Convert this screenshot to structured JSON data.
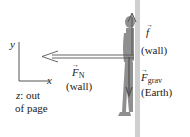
{
  "axes": {
    "y_label": "y",
    "x_label": "x",
    "z_note_var": "z",
    "z_note_text": ": out",
    "z_note_line2": "of page"
  },
  "forces": {
    "normal": {
      "symbol": "F",
      "subscript": "N",
      "source": "(wall)",
      "direction": "left"
    },
    "friction": {
      "symbol": "f",
      "subscript": "",
      "source": "(wall)",
      "direction": "up"
    },
    "gravity": {
      "symbol": "F",
      "subscript": "grav",
      "source": "(Earth)",
      "direction": "down"
    }
  },
  "colors": {
    "wall": "#c8c8c8",
    "person": "#8c8c8c",
    "arrow": "#555555",
    "axis": "#555555"
  }
}
